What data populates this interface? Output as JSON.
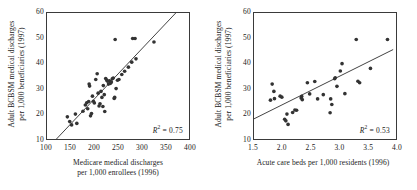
{
  "figure": {
    "background_color": "#ffffff",
    "ink_color": "#1a1a1a",
    "point_color": "#333333",
    "frame_color": "#3a3a3a",
    "panel_count": 2
  },
  "chart_data": [
    {
      "type": "scatter",
      "panel": "left",
      "title": "",
      "xlabel": "Medicare medical discharges per 1,000 enrollees (1996)",
      "xlabel_line1": "Medicare medical discharges",
      "xlabel_line2": "per 1,000 enrollees (1996)",
      "ylabel": "Adult BCBSM medical discharges per 1,000 beneficiaries (1997)",
      "ylabel_line1": "Adult BCBSM medical discharges",
      "ylabel_line2": "per 1,000 beneficiaries (1997)",
      "xlim": [
        100,
        400
      ],
      "ylim": [
        10,
        60
      ],
      "xticks": [
        100,
        150,
        200,
        250,
        300,
        350,
        400
      ],
      "xtick_labels": [
        "100",
        "150",
        "200",
        "250",
        "300",
        "350",
        "400"
      ],
      "yticks": [
        10,
        20,
        30,
        40,
        50,
        60
      ],
      "ytick_labels": [
        "10",
        "20",
        "30",
        "40",
        "50",
        "60"
      ],
      "grid": false,
      "legend": "none",
      "annotation": "R2 = 0.75",
      "r_squared": 0.75,
      "r_squared_label": "0.75",
      "fit_line": {
        "x0": 120,
        "y0": 10,
        "x1": 372,
        "y1": 60
      },
      "points": [
        [
          143,
          18.8
        ],
        [
          148,
          16.9
        ],
        [
          152,
          15.6
        ],
        [
          160,
          19.9
        ],
        [
          163,
          16.2
        ],
        [
          176,
          21.0
        ],
        [
          181,
          23.5
        ],
        [
          184,
          24.4
        ],
        [
          186,
          22.0
        ],
        [
          188,
          24.9
        ],
        [
          189,
          31.8
        ],
        [
          190,
          31.0
        ],
        [
          192,
          19.2
        ],
        [
          194,
          20.1
        ],
        [
          196,
          27.0
        ],
        [
          198,
          25.0
        ],
        [
          200,
          24.3
        ],
        [
          203,
          33.6
        ],
        [
          206,
          35.9
        ],
        [
          208,
          28.2
        ],
        [
          210,
          23.1
        ],
        [
          212,
          24.0
        ],
        [
          214,
          28.9
        ],
        [
          216,
          26.5
        ],
        [
          218,
          22.9
        ],
        [
          219,
          31.2
        ],
        [
          221,
          27.6
        ],
        [
          222,
          20.9
        ],
        [
          224,
          34.0
        ],
        [
          226,
          33.4
        ],
        [
          228,
          32.9
        ],
        [
          230,
          31.8
        ],
        [
          232,
          33.1
        ],
        [
          234,
          32.1
        ],
        [
          236,
          32.6
        ],
        [
          238,
          33.9
        ],
        [
          240,
          34.2
        ],
        [
          242,
          26.1
        ],
        [
          243,
          26.5
        ],
        [
          244,
          49.5
        ],
        [
          246,
          30.0
        ],
        [
          249,
          33.3
        ],
        [
          252,
          33.6
        ],
        [
          258,
          35.6
        ],
        [
          264,
          36.9
        ],
        [
          272,
          38.5
        ],
        [
          279,
          40.5
        ],
        [
          281,
          49.9
        ],
        [
          286,
          49.9
        ],
        [
          288,
          41.8
        ],
        [
          326,
          48.5
        ]
      ]
    },
    {
      "type": "scatter",
      "panel": "right",
      "title": "",
      "xlabel": "Acute care beds per 1,000 residents (1996)",
      "xlabel_line1": "Acute care beds per 1,000 residents (1996)",
      "ylabel": "Adult BCBSM medical discharges per 1,000 beneficiaries (1997)",
      "ylabel_line1": "Adult BCBSM medical discharges",
      "ylabel_line2": "per 1,000 beneficiaries (1997)",
      "xlim": [
        1.5,
        4.0
      ],
      "ylim": [
        10,
        60
      ],
      "xticks": [
        1.5,
        2.0,
        2.5,
        3.0,
        3.5,
        4.0
      ],
      "xtick_labels": [
        "1.5",
        "2.0",
        "2.5",
        "3.0",
        "3.5",
        "4.0"
      ],
      "yticks": [
        10,
        20,
        30,
        40,
        50,
        60
      ],
      "ytick_labels": [
        "10",
        "20",
        "30",
        "40",
        "50",
        "60"
      ],
      "grid": false,
      "legend": "none",
      "annotation": "R2 = 0.53",
      "r_squared": 0.53,
      "r_squared_label": "0.53",
      "fit_line": {
        "x0": 1.5,
        "y0": 18.0,
        "x1": 3.95,
        "y1": 45.5
      },
      "points": [
        [
          1.79,
          25.4
        ],
        [
          1.82,
          31.8
        ],
        [
          1.85,
          28.9
        ],
        [
          1.86,
          26.0
        ],
        [
          1.96,
          27.0
        ],
        [
          1.99,
          26.6
        ],
        [
          2.04,
          17.8
        ],
        [
          2.06,
          17.2
        ],
        [
          2.08,
          19.9
        ],
        [
          2.1,
          15.8
        ],
        [
          2.18,
          20.5
        ],
        [
          2.22,
          21.5
        ],
        [
          2.25,
          21.4
        ],
        [
          2.33,
          26.3
        ],
        [
          2.34,
          26.9
        ],
        [
          2.35,
          25.6
        ],
        [
          2.44,
          32.3
        ],
        [
          2.48,
          27.9
        ],
        [
          2.57,
          32.8
        ],
        [
          2.62,
          25.9
        ],
        [
          2.72,
          27.6
        ],
        [
          2.84,
          20.4
        ],
        [
          2.85,
          25.9
        ],
        [
          2.87,
          23.7
        ],
        [
          2.92,
          33.9
        ],
        [
          2.93,
          34.3
        ],
        [
          2.96,
          30.9
        ],
        [
          3.02,
          37.0
        ],
        [
          3.05,
          39.9
        ],
        [
          3.1,
          28.0
        ],
        [
          3.3,
          49.5
        ],
        [
          3.33,
          32.9
        ],
        [
          3.36,
          32.3
        ],
        [
          3.55,
          38.0
        ],
        [
          3.85,
          49.5
        ]
      ]
    }
  ]
}
